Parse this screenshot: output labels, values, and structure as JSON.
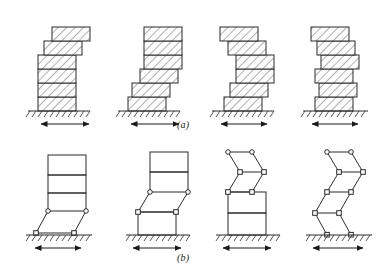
{
  "figure": {
    "background": "#ffffff",
    "line_color": "#2b2b2b",
    "hatch_color": "#555555",
    "fill_color": "#fbfbfb",
    "ground_color": "#2b2b2b",
    "arrow_color": "#1a1a1a",
    "width": 389,
    "height": 274
  },
  "captions": {
    "row_a": "(a)",
    "row_b": "(b)"
  },
  "rows": [
    {
      "id": "row-a",
      "label": "(a)",
      "kind": "hatched-block-stack",
      "description": "Rigid storey blocks with diagonal hatching, progressively offset",
      "models": [
        {
          "name": "model-a1",
          "mode": "shear",
          "base_x": 38,
          "ground_y": 111,
          "block_w": 38,
          "block_h": 14,
          "n_blocks": 6,
          "offsets": [
            0,
            0,
            0,
            0,
            6,
            14
          ],
          "arrow": {
            "x1": 40,
            "x2": 90,
            "y": 124,
            "double": true
          }
        },
        {
          "name": "model-a2",
          "mode": "shear-flexure",
          "base_x": 128,
          "ground_y": 111,
          "block_w": 38,
          "block_h": 14,
          "n_blocks": 6,
          "offsets": [
            0,
            4,
            12,
            16,
            16,
            16
          ],
          "arrow": {
            "x1": 130,
            "x2": 180,
            "y": 124,
            "double": true
          }
        },
        {
          "name": "model-a3",
          "mode": "flexure",
          "base_x": 218,
          "ground_y": 111,
          "block_w": 38,
          "block_h": 14,
          "n_blocks": 6,
          "offsets": [
            0,
            6,
            12,
            12,
            6,
            0
          ],
          "arrow": {
            "x1": 220,
            "x2": 268,
            "y": 124,
            "double": true
          }
        },
        {
          "name": "model-a4",
          "mode": "zigzag",
          "base_x": 307,
          "ground_y": 111,
          "block_w": 38,
          "block_h": 14,
          "n_blocks": 6,
          "offsets": [
            0,
            4,
            0,
            6,
            2,
            -4
          ],
          "arrow": {
            "x1": 309,
            "x2": 357,
            "y": 124,
            "double": true
          }
        }
      ]
    },
    {
      "id": "row-b",
      "label": "(b)",
      "kind": "pin-jointed-frame",
      "description": "Idealized frames with hinge (pin) nodes at deformed storeys",
      "models": [
        {
          "name": "model-b1",
          "ground_y": 247,
          "rigid_storeys": 3,
          "hinged_storeys": 1,
          "arrow": {
            "x1": 42,
            "x2": 90,
            "y": 258,
            "double": true
          }
        },
        {
          "name": "model-b2",
          "ground_y": 247,
          "rigid_storeys": 2,
          "hinged_storeys": 2,
          "arrow": {
            "x1": 132,
            "x2": 180,
            "y": 258,
            "double": true
          }
        },
        {
          "name": "model-b3",
          "ground_y": 247,
          "rigid_storeys": 2,
          "hinged_storeys": 3,
          "arrow": {
            "x1": 222,
            "x2": 270,
            "y": 258,
            "double": true
          }
        },
        {
          "name": "model-b4",
          "ground_y": 247,
          "rigid_storeys": 0,
          "hinged_storeys": 4,
          "arrow": {
            "x1": 312,
            "x2": 362,
            "y": 258,
            "double": true
          }
        }
      ]
    }
  ]
}
